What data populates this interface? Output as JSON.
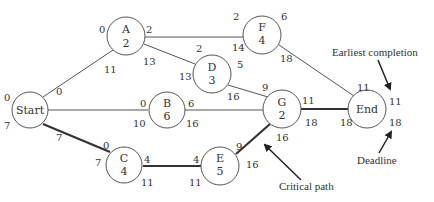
{
  "nodes": {
    "start": {
      "name": "Start",
      "duration": "",
      "tl": "0",
      "bl": "7",
      "tr": "0",
      "br": "7"
    },
    "a": {
      "name": "A",
      "duration": "2",
      "tl": "0",
      "tr": "2",
      "bl": "11",
      "br": "13"
    },
    "b": {
      "name": "B",
      "duration": "6",
      "tl": "0",
      "tr": "6",
      "bl": "10",
      "br": "16"
    },
    "c": {
      "name": "C",
      "duration": "4",
      "tl": "0",
      "tr": "4",
      "bl": "7",
      "br": "11"
    },
    "d": {
      "name": "D",
      "duration": "3",
      "tl": "2",
      "tr": "5",
      "bl": "13",
      "br": "16"
    },
    "e": {
      "name": "E",
      "duration": "5",
      "tl": "4",
      "tr": "9",
      "bl": "11",
      "br": "16"
    },
    "f": {
      "name": "F",
      "duration": "4",
      "tl": "2",
      "tr": "6",
      "bl": "14",
      "br": "18"
    },
    "g": {
      "name": "G",
      "duration": "2",
      "tl": "9",
      "tr": "11",
      "bl": "16",
      "br": "18"
    },
    "end": {
      "name": "End",
      "duration": "",
      "tl": "11",
      "tr": "11",
      "bl": "18",
      "br": "18"
    }
  },
  "edges": [
    {
      "from": "Start",
      "to": "A",
      "critical": false
    },
    {
      "from": "Start",
      "to": "B",
      "critical": false
    },
    {
      "from": "Start",
      "to": "C",
      "critical": true
    },
    {
      "from": "A",
      "to": "F",
      "critical": false
    },
    {
      "from": "A",
      "to": "D",
      "critical": false
    },
    {
      "from": "D",
      "to": "G",
      "critical": false
    },
    {
      "from": "B",
      "to": "G",
      "critical": false
    },
    {
      "from": "C",
      "to": "E",
      "critical": true
    },
    {
      "from": "E",
      "to": "G",
      "critical": true
    },
    {
      "from": "F",
      "to": "End",
      "critical": false
    },
    {
      "from": "G",
      "to": "End",
      "critical": true
    }
  ],
  "annotations": {
    "earliest_completion": "Earliest completion",
    "deadline": "Deadline",
    "critical_path": "Critical path"
  },
  "colors": {
    "line": "#555555",
    "critical_line": "#333333",
    "text": "#333333"
  }
}
